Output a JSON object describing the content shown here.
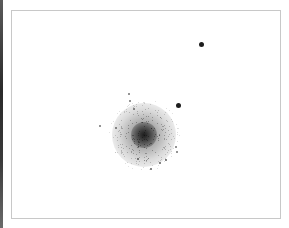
{
  "image": {
    "subject": "globular star cluster (negative / inverted astronomical image)",
    "background_color": "#ffffff",
    "frame_color": "#c8c8c8",
    "star_color": "#111111"
  },
  "cluster": {
    "center_x": 132,
    "center_y": 124,
    "halo_diameter": 64,
    "core_diameter": 26
  },
  "bright_stars": [
    {
      "x": 189,
      "y": 33,
      "size": 5
    },
    {
      "x": 166,
      "y": 94,
      "size": 5
    }
  ],
  "faint_stars": [
    {
      "x": 117,
      "y": 83,
      "size": 2
    },
    {
      "x": 118,
      "y": 90,
      "size": 2
    },
    {
      "x": 122,
      "y": 98,
      "size": 2
    },
    {
      "x": 88,
      "y": 115,
      "size": 2
    },
    {
      "x": 104,
      "y": 117,
      "size": 2
    },
    {
      "x": 164,
      "y": 136,
      "size": 2
    },
    {
      "x": 165,
      "y": 141,
      "size": 2
    },
    {
      "x": 126,
      "y": 148,
      "size": 1.5
    },
    {
      "x": 148,
      "y": 152,
      "size": 1.5
    },
    {
      "x": 154,
      "y": 149,
      "size": 1.5
    },
    {
      "x": 139,
      "y": 158,
      "size": 1.5
    }
  ]
}
